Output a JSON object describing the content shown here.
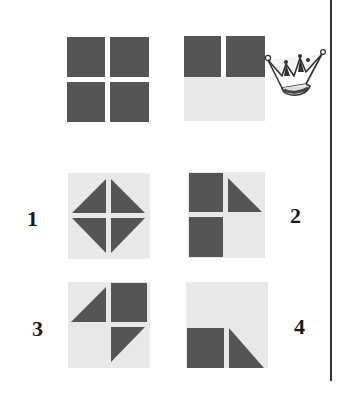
{
  "colors": {
    "dark": "#555555",
    "light": "#e6e6e6",
    "line": "#333333"
  },
  "question": {
    "panels": [
      {
        "name": "given-figure-full",
        "description": "four dark squares"
      },
      {
        "name": "given-figure-half",
        "description": "two dark squares on top, light bottom half"
      }
    ],
    "decoration": "crown-icon"
  },
  "options": [
    {
      "label": "1",
      "description": "diamond of four triangles"
    },
    {
      "label": "2",
      "description": "two squares left, triangle top-right"
    },
    {
      "label": "3",
      "description": "triangle top-left, square top-right, triangle bottom-right"
    },
    {
      "label": "4",
      "description": "square bottom-left, triangle bottom-right"
    }
  ]
}
